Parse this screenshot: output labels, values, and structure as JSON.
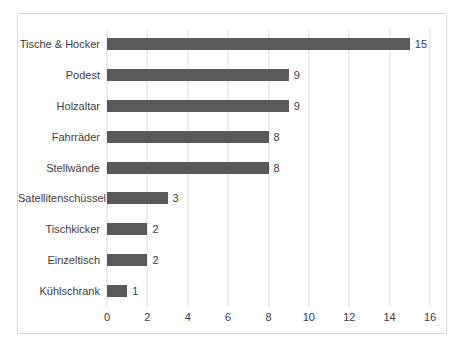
{
  "chart_data": {
    "type": "bar",
    "orientation": "horizontal",
    "title": "",
    "xlabel": "",
    "ylabel": "",
    "categories": [
      "Tische & Hocker",
      "Podest",
      "Holzaltar",
      "Fahrräder",
      "Stellwände",
      "Satellitenschüssel",
      "Tischkicker",
      "Einzeltisch",
      "Kühlschrank"
    ],
    "values": [
      15,
      9,
      9,
      8,
      8,
      3,
      2,
      2,
      1
    ],
    "data_labels": [
      "15",
      "9",
      "9",
      "8",
      "8",
      "3",
      "2",
      "2",
      "1"
    ],
    "xticks": [
      0,
      2,
      4,
      6,
      8,
      10,
      12,
      14,
      16
    ],
    "xlim": [
      0,
      16
    ],
    "grid": "vertical-on",
    "legend": "none",
    "colors": {
      "bar": "#595959",
      "gridline": "#d9d9d9",
      "frame_border": "#d9d9d9",
      "text": "#404040",
      "background": "#ffffff"
    }
  }
}
